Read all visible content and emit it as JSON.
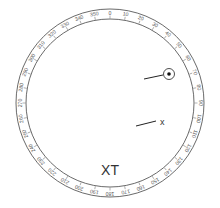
{
  "dial": {
    "center": [
      110,
      103
    ],
    "outer_radius": 94,
    "inner_radius": 84,
    "stroke_color": "#444444",
    "degree_labels": [
      "0",
      "10",
      "20",
      "30",
      "40",
      "50",
      "60",
      "70",
      "80",
      "90",
      "100",
      "110",
      "120",
      "130",
      "140",
      "150",
      "160",
      "170",
      "180",
      "190",
      "200",
      "210",
      "220",
      "230",
      "240",
      "250",
      "260",
      "270",
      "280",
      "290",
      "300",
      "310",
      "320",
      "330",
      "340",
      "350"
    ]
  },
  "marker": {
    "center": [
      169,
      74
    ],
    "radius": 5.5,
    "dot_radius": 1.8,
    "line": [
      [
        144,
        79
      ],
      [
        163,
        75
      ]
    ]
  },
  "pointer_x": {
    "line": [
      [
        136,
        126
      ],
      [
        156,
        121
      ]
    ],
    "label": "x",
    "label_pos": [
      160,
      125
    ]
  },
  "title": {
    "text": "XT",
    "pos": [
      110,
      175
    ]
  }
}
